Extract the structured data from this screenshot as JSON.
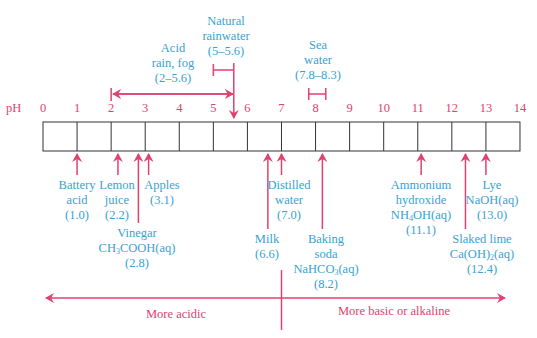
{
  "colors": {
    "accent": "#e0426f",
    "label": "#3a9fd3",
    "box": "#333333"
  },
  "scale": {
    "axis_label": "pH",
    "ticks": [
      "0",
      "1",
      "2",
      "3",
      "4",
      "5",
      "6",
      "7",
      "8",
      "9",
      "10",
      "11",
      "12",
      "13",
      "14"
    ]
  },
  "ranges": [
    {
      "name": "Natural rainwater",
      "lines": [
        "Natural",
        "rainwater",
        "(5–5.6)"
      ],
      "min": 5,
      "max": 5.6
    },
    {
      "name": "Acid rain, fog",
      "lines": [
        "Acid",
        "rain, fog",
        "(2–5.6)"
      ],
      "min": 2,
      "max": 5.6
    },
    {
      "name": "Sea water",
      "lines": [
        "Sea",
        "water",
        "(7.8–8.3)"
      ],
      "min": 7.8,
      "max": 8.3
    }
  ],
  "substances": [
    {
      "name": "Battery acid",
      "lines": [
        "Battery",
        "acid",
        "(1.0)"
      ],
      "ph": 1.0
    },
    {
      "name": "Lemon juice",
      "lines": [
        "Lemon",
        "juice",
        "(2.2)"
      ],
      "ph": 2.2
    },
    {
      "name": "Apples",
      "lines": [
        "Apples",
        "(3.1)"
      ],
      "ph": 3.1
    },
    {
      "name": "Vinegar",
      "lines": [
        "Vinegar",
        "CH3COOH(aq)",
        "(2.8)"
      ],
      "ph": 2.8
    },
    {
      "name": "Milk",
      "lines": [
        "Milk",
        "(6.6)"
      ],
      "ph": 6.6
    },
    {
      "name": "Distilled water",
      "lines": [
        "Distilled",
        "water",
        "(7.0)"
      ],
      "ph": 7.0
    },
    {
      "name": "Baking soda",
      "lines": [
        "Baking",
        "soda",
        "NaHCO3(aq)",
        "(8.2)"
      ],
      "ph": 8.2
    },
    {
      "name": "Ammonium hydroxide",
      "lines": [
        "Ammonium",
        "hydroxide",
        "NH4OH(aq)",
        "(11.1)"
      ],
      "ph": 11.1
    },
    {
      "name": "Slaked lime",
      "lines": [
        "Slaked lime",
        "Ca(OH)2(aq)",
        "(12.4)"
      ],
      "ph": 12.4
    },
    {
      "name": "Lye",
      "lines": [
        "Lye",
        "NaOH(aq)",
        "(13.0)"
      ],
      "ph": 13.0
    }
  ],
  "direction": {
    "acidic": "More acidic",
    "basic": "More basic or alkaline"
  }
}
